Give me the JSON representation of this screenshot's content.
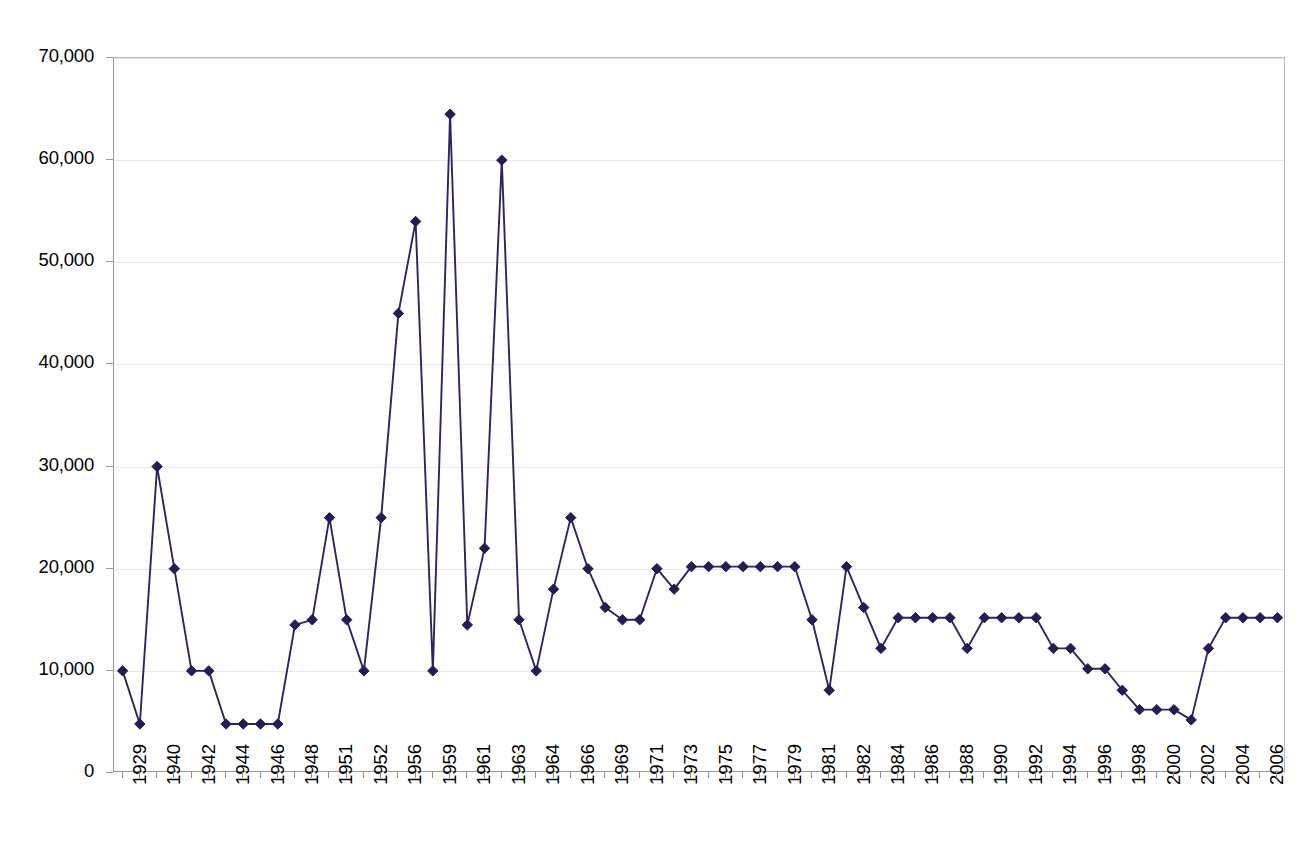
{
  "chart_data": {
    "type": "line",
    "title": "",
    "subtitle": "",
    "xlabel": "",
    "ylabel": "",
    "ylim": [
      0,
      70000
    ],
    "y_ticks": [
      0,
      10000,
      20000,
      30000,
      40000,
      50000,
      60000,
      70000
    ],
    "y_tick_labels": [
      "0",
      "10,000",
      "20,000",
      "30,000",
      "40,000",
      "50,000",
      "60,000",
      "70,000"
    ],
    "grid": true,
    "legend": "none",
    "marker": "diamond",
    "series_color": "#2e2560",
    "marker_color": "#241c52",
    "categories": [
      "1929",
      "1939",
      "1940",
      "1941",
      "1942",
      "1943",
      "1944",
      "1945",
      "1946",
      "1947",
      "1948",
      "1950",
      "1951",
      "1952",
      "1953",
      "1956",
      "1957",
      "1958",
      "1959",
      "1960",
      "1961",
      "1962",
      "1963",
      "1964",
      "1965",
      "1966",
      "1967",
      "1969",
      "1970",
      "1971",
      "1972",
      "1973",
      "1974",
      "1975",
      "1976",
      "1977",
      "1978",
      "1979",
      "1980",
      "1981",
      "1982",
      "1983",
      "1984",
      "1985",
      "1986",
      "1987",
      "1988",
      "1989",
      "1990",
      "1991",
      "1992",
      "1993",
      "1994",
      "1995",
      "1996",
      "1997",
      "1998",
      "1999",
      "2000",
      "2001",
      "2002",
      "2003",
      "2004",
      "2005",
      "2006",
      "2007",
      "2008",
      "2009"
    ],
    "x_tick_labels": [
      "1929",
      "",
      "1940",
      "",
      "1942",
      "",
      "1944",
      "",
      "1946",
      "",
      "1948",
      "",
      "1951",
      "",
      "1952",
      "",
      "1956",
      "",
      "1959",
      "",
      "1961",
      "",
      "1963",
      "",
      "1964",
      "",
      "1966",
      "",
      "1969",
      "",
      "1971",
      "",
      "1973",
      "",
      "1975",
      "",
      "1977",
      "",
      "1979",
      "",
      "1981",
      "",
      "1982",
      "",
      "1984",
      "",
      "1986",
      "",
      "1988",
      "",
      "1990",
      "",
      "1992",
      "",
      "1994",
      "",
      "1996",
      "",
      "1998",
      "",
      "2000",
      "",
      "2002",
      "",
      "2004",
      "",
      "2006",
      "",
      "2008",
      ""
    ],
    "values": [
      10000,
      4800,
      30000,
      20000,
      10000,
      10000,
      4800,
      4800,
      4800,
      4800,
      14500,
      15000,
      25000,
      15000,
      10000,
      25000,
      45000,
      54000,
      10000,
      64500,
      14500,
      22000,
      60000,
      15000,
      10000,
      18000,
      25000,
      20000,
      16200,
      15000,
      15000,
      20000,
      18000,
      20200,
      20200,
      20200,
      20200,
      20200,
      20200,
      20200,
      15000,
      8100,
      20200,
      16200,
      12200,
      15200,
      15200,
      15200,
      15200,
      12200,
      15200,
      15200,
      15200,
      15200,
      12200,
      12200,
      10200,
      10200,
      8100,
      6200,
      6200,
      6200,
      5200,
      12200,
      15200,
      15200,
      15200,
      15200
    ]
  },
  "axis": {
    "y_axis_name": "value-axis",
    "x_axis_name": "year-axis"
  }
}
